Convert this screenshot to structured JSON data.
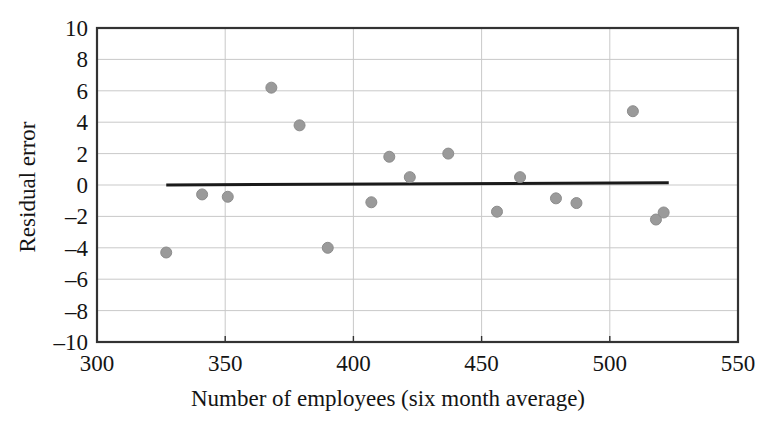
{
  "chart_data": {
    "type": "scatter",
    "title": "",
    "xlabel": "Number of employees (six month average)",
    "ylabel": "Residual error",
    "xlim": [
      300,
      550
    ],
    "ylim": [
      -10,
      10
    ],
    "xticks": [
      300,
      350,
      400,
      450,
      500,
      550
    ],
    "xtick_labels": [
      "300",
      "350",
      "400",
      "450",
      "500",
      "550"
    ],
    "yticks": [
      10,
      8,
      6,
      4,
      2,
      0,
      -2,
      -4,
      -6,
      -8,
      -10
    ],
    "ytick_labels": [
      "10",
      "8",
      "6",
      "4",
      "2",
      "0",
      "–2",
      "–4",
      "–6",
      "–8",
      "–10"
    ],
    "grid": true,
    "grid_axis": "y",
    "legend": "none",
    "marker": {
      "shape": "circle",
      "color": "#9a9a9a",
      "edge_color": "#8c8c8c",
      "size": 11
    },
    "x": [
      327,
      341,
      351,
      368,
      379,
      390,
      407,
      414,
      422,
      437,
      456,
      465,
      479,
      487,
      509,
      518,
      521
    ],
    "y": [
      -4.3,
      -0.6,
      -0.75,
      6.2,
      3.8,
      -4.0,
      -1.1,
      1.8,
      0.5,
      2.0,
      -1.7,
      0.5,
      -0.85,
      -1.15,
      4.7,
      -2.2,
      -1.75
    ],
    "points": [
      {
        "x": 327,
        "y": -4.3
      },
      {
        "x": 341,
        "y": -0.6
      },
      {
        "x": 351,
        "y": -0.75
      },
      {
        "x": 368,
        "y": 6.2
      },
      {
        "x": 379,
        "y": 3.8
      },
      {
        "x": 390,
        "y": -4.0
      },
      {
        "x": 407,
        "y": -1.1
      },
      {
        "x": 414,
        "y": 1.8
      },
      {
        "x": 422,
        "y": 0.5
      },
      {
        "x": 437,
        "y": 2.0
      },
      {
        "x": 456,
        "y": -1.7
      },
      {
        "x": 465,
        "y": 0.5
      },
      {
        "x": 479,
        "y": -0.85
      },
      {
        "x": 487,
        "y": -1.15
      },
      {
        "x": 509,
        "y": 4.7
      },
      {
        "x": 518,
        "y": -2.2
      },
      {
        "x": 521,
        "y": -1.75
      }
    ],
    "series": [
      {
        "name": "residuals",
        "type": "scatter",
        "x": [
          327,
          341,
          351,
          368,
          379,
          390,
          407,
          414,
          422,
          437,
          456,
          465,
          479,
          487,
          509,
          518,
          521
        ],
        "values": [
          -4.3,
          -0.6,
          -0.75,
          6.2,
          3.8,
          -4.0,
          -1.1,
          1.8,
          0.5,
          2.0,
          -1.7,
          0.5,
          -0.85,
          -1.15,
          4.7,
          -2.2,
          -1.75
        ]
      },
      {
        "name": "reference-line",
        "type": "line",
        "color": "#1a1a1a",
        "x": [
          327,
          523
        ],
        "values": [
          0.0,
          0.15
        ]
      }
    ],
    "annotations": []
  },
  "axes": {
    "frame_color": "#333333",
    "grid_color": "#c9c9c9",
    "background": "#ffffff"
  }
}
